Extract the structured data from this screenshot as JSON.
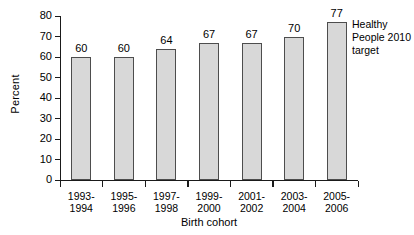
{
  "chart_data": {
    "type": "bar",
    "title": "",
    "xlabel": "Birth cohort",
    "ylabel": "Percent",
    "categories": [
      "1993-1994",
      "1995-1996",
      "1997-1998",
      "1999-2000",
      "2001-2002",
      "2003-2004",
      "2005-2006"
    ],
    "category_lines": [
      [
        "1993-",
        "1994"
      ],
      [
        "1995-",
        "1996"
      ],
      [
        "1997-",
        "1998"
      ],
      [
        "1999-",
        "2000"
      ],
      [
        "2001-",
        "2002"
      ],
      [
        "2003-",
        "2004"
      ],
      [
        "2005-",
        "2006"
      ]
    ],
    "values": [
      60,
      60,
      64,
      67,
      67,
      70,
      77
    ],
    "value_labels": [
      "60",
      "60",
      "64",
      "67",
      "67",
      "70",
      "77"
    ],
    "ylim": [
      0,
      80
    ],
    "ytick_labels": [
      "80",
      "70",
      "60",
      "50",
      "40",
      "30",
      "20",
      "10",
      "0"
    ],
    "ytick_values": [
      80,
      70,
      60,
      50,
      40,
      30,
      20,
      10,
      0
    ],
    "grid": false,
    "legend": null,
    "annotations": [
      {
        "name": "healthy-people-2010-target",
        "lines": [
          "Healthy",
          "People 2010",
          "target"
        ],
        "text": "Healthy People 2010 target",
        "attached_to_category": "2005-2006"
      }
    ],
    "colors": {
      "bar_fill": "#d8d8d8",
      "bar_border": "#4d4d4d",
      "axis": "#1a1a1a",
      "text": "#000000",
      "background": "#ffffff"
    }
  }
}
